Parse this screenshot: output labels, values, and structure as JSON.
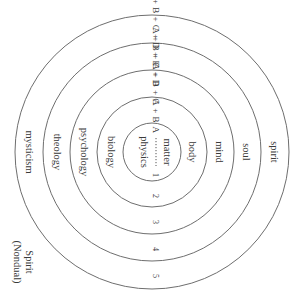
{
  "diagram": {
    "type": "concentric-circles",
    "orientation": "rotated-90-clockwise",
    "rings": [
      {
        "level": "1",
        "inner_label": "matter",
        "outer_label": "physics",
        "sequence": "A"
      },
      {
        "level": "2",
        "inner_label": "body",
        "outer_label": "biology",
        "sequence": "A + B"
      },
      {
        "level": "3",
        "inner_label": "mind",
        "outer_label": "psychology",
        "sequence": "A + B + C"
      },
      {
        "level": "4",
        "inner_label": "soul",
        "outer_label": "theology",
        "sequence": "A + B + C + D"
      },
      {
        "level": "5",
        "inner_label": "spirit",
        "outer_label": "mysticism",
        "sequence": "A + B + C + D + E"
      }
    ],
    "outer_caption_line1": "Spirit",
    "outer_caption_line2": "(Nondual)",
    "colors": {
      "stroke": "#6e6e6e",
      "text": "#3a3a3a",
      "background": "#ffffff"
    }
  }
}
